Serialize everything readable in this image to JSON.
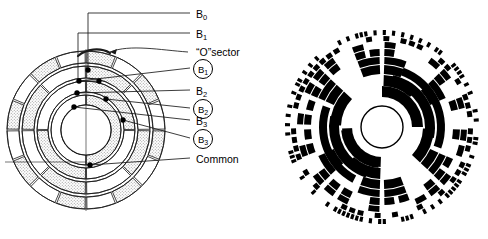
{
  "figure": {
    "stroke_color": "#000000",
    "fill_color": "#000000",
    "stipple_color": "#9a9a9a",
    "background": "#ffffff"
  },
  "left_diagram": {
    "name": "brush-contact-encoder-schematic",
    "center": {
      "x": 86,
      "y": 130
    },
    "outer_radius": 79,
    "hub_radius": 25,
    "rings": [
      {
        "index": 0,
        "r_outer": 79,
        "r_inner": 67,
        "segments": 16
      },
      {
        "index": 1,
        "r_outer": 64,
        "r_inner": 52,
        "segments": 8
      },
      {
        "index": 2,
        "r_outer": 49,
        "r_inner": 38,
        "segments": 4
      },
      {
        "index": 3,
        "r_outer": 35,
        "r_inner": 25,
        "segments": 2
      }
    ],
    "brushes": [
      {
        "name": "brush-b0",
        "x": 88,
        "y": 70
      },
      {
        "name": "brush-b1-circled",
        "x": 79,
        "y": 81
      },
      {
        "name": "brush-b1",
        "x": 99,
        "y": 81
      },
      {
        "name": "brush-b2",
        "x": 77,
        "y": 93
      },
      {
        "name": "brush-b2-circled",
        "x": 106,
        "y": 99
      },
      {
        "name": "brush-b3",
        "x": 74,
        "y": 107
      },
      {
        "name": "brush-b3-circled",
        "x": 123,
        "y": 120
      },
      {
        "name": "brush-common",
        "x": 90,
        "y": 165
      }
    ]
  },
  "labels": [
    {
      "id": "b0",
      "text": "B",
      "sub": "0",
      "circled": false,
      "x": 196,
      "y": 9,
      "lead_y": 13
    },
    {
      "id": "b1",
      "text": "B",
      "sub": "1",
      "circled": false,
      "x": 196,
      "y": 29,
      "lead_y": 33
    },
    {
      "id": "o_sector",
      "text": "“O”sector",
      "sub": "",
      "circled": false,
      "x": 196,
      "y": 47,
      "lead_y": 52
    },
    {
      "id": "b1_circled",
      "text": "B",
      "sub": "1",
      "circled": true,
      "x": 193,
      "y": 59,
      "lead_y": 68
    },
    {
      "id": "b2",
      "text": "B",
      "sub": "2",
      "circled": false,
      "x": 196,
      "y": 86,
      "lead_y": 90
    },
    {
      "id": "b2_circled",
      "text": "B",
      "sub": "2",
      "circled": true,
      "x": 193,
      "y": 99,
      "lead_y": 108
    },
    {
      "id": "b3",
      "text": "B",
      "sub": "3",
      "circled": false,
      "x": 196,
      "y": 116,
      "lead_y": 120
    },
    {
      "id": "b3_circled",
      "text": "B",
      "sub": "3",
      "circled": true,
      "x": 193,
      "y": 129,
      "lead_y": 138
    },
    {
      "id": "common",
      "text": "Common",
      "sub": "",
      "circled": false,
      "x": 196,
      "y": 154,
      "lead_y": 158
    }
  ],
  "right_diagram": {
    "name": "absolute-code-disc",
    "center": {
      "x": 382,
      "y": 127
    },
    "outer_radius": 97,
    "hub_radius": 21,
    "track_count": 10,
    "description": "Absolute position code disc with concentric binary tracks; inner tracks coarse arcs, outer tracks fine alternating segments",
    "tracks": [
      {
        "index": 0,
        "r_inner": 26,
        "r_outer": 40,
        "divisions": 4
      },
      {
        "index": 1,
        "r_inner": 41,
        "r_outer": 52,
        "divisions": 8
      },
      {
        "index": 2,
        "r_inner": 53,
        "r_outer": 62,
        "divisions": 16
      },
      {
        "index": 3,
        "r_inner": 63,
        "r_outer": 70,
        "divisions": 16
      },
      {
        "index": 4,
        "r_inner": 71,
        "r_outer": 78,
        "divisions": 32
      },
      {
        "index": 5,
        "r_inner": 79,
        "r_outer": 85,
        "divisions": 32
      },
      {
        "index": 6,
        "r_inner": 86,
        "r_outer": 91,
        "divisions": 64
      },
      {
        "index": 7,
        "r_inner": 92,
        "r_outer": 97,
        "divisions": 128
      }
    ]
  }
}
